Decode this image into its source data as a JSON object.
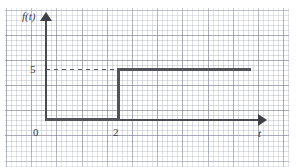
{
  "figure": {
    "kind": "step-function-plot",
    "background": "graph-paper",
    "ink_color": "#4a4a52",
    "grid_minor_color": "#969caa",
    "grid_major_color": "#787e8c"
  },
  "axes": {
    "y_axis_label": "f(t)",
    "x_axis_label": "t",
    "origin_label": "0",
    "y_tick_label": "5",
    "x_tick_label": "2",
    "y_arrow_icon": "arrow-up-icon",
    "x_arrow_icon": "arrow-right-icon"
  },
  "guides": {
    "dashed_level_value": "5"
  },
  "chart_data": {
    "type": "line",
    "title": "",
    "xlabel": "t",
    "ylabel": "f(t)",
    "xlim": [
      0,
      8.7
    ],
    "ylim": [
      0,
      7.2
    ],
    "grid": true,
    "legend": "none",
    "series": [
      {
        "name": "f(t)",
        "style": "step-solid",
        "points": [
          {
            "x": 0,
            "y": 0
          },
          {
            "x": 2,
            "y": 0
          },
          {
            "x": 2,
            "y": 5
          },
          {
            "x": 8.1,
            "y": 5
          }
        ]
      },
      {
        "name": "level guide f = 5",
        "style": "dashed",
        "points": [
          {
            "x": 0,
            "y": 5
          },
          {
            "x": 2,
            "y": 5
          }
        ]
      }
    ],
    "annotations": [
      {
        "text": "5",
        "x": 0,
        "y": 5,
        "placement": "left-of-axis"
      },
      {
        "text": "2",
        "x": 2,
        "y": 0,
        "placement": "below-axis"
      },
      {
        "text": "0",
        "x": 0,
        "y": 0,
        "placement": "below-left-of-origin"
      },
      {
        "text": "f(t)",
        "x": 0,
        "y": 7.2,
        "placement": "left-of-y-arrow"
      },
      {
        "text": "t",
        "x": 8.7,
        "y": 0,
        "placement": "below-x-arrow"
      }
    ]
  }
}
